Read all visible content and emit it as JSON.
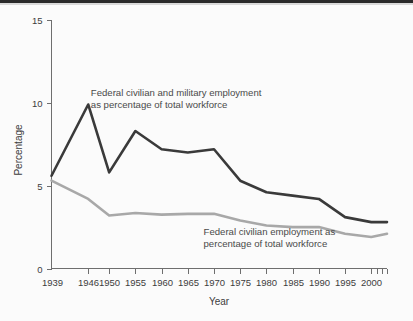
{
  "figure": {
    "background_color": "#fbfbfb",
    "width": 413,
    "height": 321
  },
  "chart_data": {
    "type": "line",
    "title": "",
    "xlabel": "Year",
    "ylabel": "Percentage",
    "xlim": [
      1939,
      2003
    ],
    "ylim": [
      0,
      15
    ],
    "yticks": [
      0,
      5,
      10,
      15
    ],
    "ytick_labels": [
      "0",
      "5",
      "10",
      "15"
    ],
    "xticks": [
      1939,
      1946,
      1950,
      1955,
      1960,
      1965,
      1970,
      1975,
      1980,
      1985,
      1990,
      1995,
      2000,
      2001,
      2002,
      2003
    ],
    "xtick_labels": [
      "1939",
      "1946",
      "1950",
      "1955",
      "1960",
      "1965",
      "1970",
      "1975",
      "1980",
      "1985",
      "1990",
      "1995",
      "2000",
      "",
      "",
      ""
    ],
    "grid": false,
    "legend_position": "inline-annotations",
    "series": [
      {
        "name": "Federal civilian and military employment as percentage of total workforce",
        "color": "#3a3a3a",
        "linewidth": 2.6,
        "x": [
          1939,
          1946,
          1950,
          1955,
          1960,
          1965,
          1970,
          1975,
          1980,
          1985,
          1990,
          1995,
          2000,
          2003
        ],
        "values": [
          5.6,
          9.9,
          5.8,
          8.3,
          7.2,
          7.0,
          7.2,
          5.3,
          4.6,
          4.4,
          4.2,
          3.1,
          2.8,
          2.8
        ]
      },
      {
        "name": "Federal civilian employment as percentage of total workforce",
        "color": "#a8a8a8",
        "linewidth": 2.6,
        "x": [
          1939,
          1946,
          1950,
          1955,
          1960,
          1965,
          1970,
          1975,
          1980,
          1985,
          1990,
          1995,
          2000,
          2003
        ],
        "values": [
          5.3,
          4.2,
          3.2,
          3.35,
          3.25,
          3.3,
          3.3,
          2.9,
          2.6,
          2.5,
          2.5,
          2.1,
          1.9,
          2.1
        ]
      }
    ],
    "annotations": [
      {
        "name": "total-employment-annotation",
        "line1": "Federal civilian and military employment",
        "line2": "as percentage of total workforce",
        "x": 1946.5,
        "y": 10.4
      },
      {
        "name": "civilian-employment-annotation",
        "line1": "Federal civilian employment as",
        "line2": "percentage of total workforce",
        "x": 1968,
        "y": 2.0
      }
    ]
  }
}
